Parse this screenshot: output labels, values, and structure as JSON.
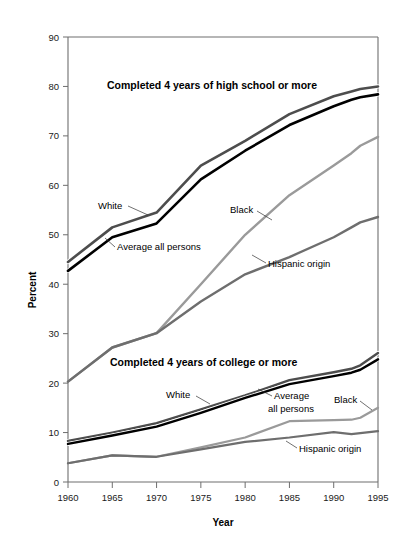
{
  "figure": {
    "background": "#ffffff",
    "axis_color": "#6e6e6e"
  },
  "axes": {
    "xlabel": "Year",
    "ylabel": "Percent",
    "x_ticks": [
      "1960",
      "1965",
      "1970",
      "1975",
      "1980",
      "1985",
      "1990",
      "1995"
    ],
    "y_ticks": [
      "0",
      "10",
      "20",
      "30",
      "40",
      "50",
      "60",
      "70",
      "80",
      "90"
    ]
  },
  "panels": {
    "highschool_title": "Completed 4 years of high school or more",
    "college_title": "Completed 4 years of college or more"
  },
  "labels": {
    "white_hs": "White",
    "average_hs": "Average all persons",
    "black_hs": "Black",
    "hispanic_hs": "Hispanic origin",
    "white_col": "White",
    "average_col_line1": "Average",
    "average_col_line2": "all persons",
    "black_col": "Black",
    "hispanic_col": "Hispanic origin"
  },
  "chart_data": {
    "type": "line",
    "title": "",
    "xlabel": "Year",
    "ylabel": "Percent",
    "xlim": [
      1960,
      1995
    ],
    "ylim": [
      0,
      90
    ],
    "grid": false,
    "legend_position": "inline-annotations",
    "x": [
      1960,
      1965,
      1970,
      1975,
      1980,
      1985,
      1990,
      1992,
      1993,
      1995
    ],
    "groups": [
      {
        "name": "Completed 4 years of high school or more",
        "series": [
          {
            "name": "White",
            "color": "#4d4d4d",
            "width": 2.6,
            "values": [
              44.5,
              51.5,
              54.5,
              64.0,
              69.0,
              74.4,
              78.0,
              79.0,
              79.5,
              80.0
            ]
          },
          {
            "name": "Average all persons",
            "color": "#000000",
            "width": 2.6,
            "values": [
              42.7,
              49.5,
              52.3,
              61.2,
              67.0,
              72.2,
              76.0,
              77.3,
              77.8,
              78.4
            ]
          },
          {
            "name": "Black",
            "color": "#9a9a9a",
            "width": 2.4,
            "values": [
              20.3,
              27.2,
              30.1,
              40.0,
              50.0,
              58.0,
              64.0,
              66.5,
              68.0,
              69.8
            ]
          },
          {
            "name": "Hispanic origin",
            "color": "#6e6e6e",
            "width": 2.4,
            "values": [
              20.3,
              27.2,
              30.1,
              36.5,
              42.0,
              45.5,
              49.5,
              51.5,
              52.5,
              53.6
            ]
          }
        ]
      },
      {
        "name": "Completed 4 years of college or more",
        "series": [
          {
            "name": "White",
            "color": "#4d4d4d",
            "width": 2.4,
            "values": [
              8.3,
              10.0,
              11.9,
              14.7,
              17.5,
              20.6,
              22.2,
              22.9,
              23.6,
              26.1
            ]
          },
          {
            "name": "Average all persons",
            "color": "#000000",
            "width": 2.4,
            "values": [
              7.7,
              9.4,
              11.2,
              14.0,
              17.0,
              19.8,
              21.4,
              22.1,
              22.7,
              24.8
            ]
          },
          {
            "name": "Black",
            "color": "#9a9a9a",
            "width": 2.2,
            "values": [
              3.8,
              5.4,
              5.1,
              7.0,
              9.0,
              12.3,
              12.5,
              12.6,
              13.0,
              15.0
            ]
          },
          {
            "name": "Hispanic origin",
            "color": "#6e6e6e",
            "width": 2.2,
            "values": [
              3.8,
              5.4,
              5.1,
              6.6,
              8.1,
              9.0,
              10.1,
              9.7,
              9.9,
              10.3
            ]
          }
        ]
      }
    ]
  }
}
